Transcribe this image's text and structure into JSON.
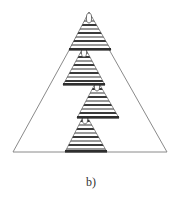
{
  "figure": {
    "caption": "b)"
  },
  "colors": {
    "outline": "#8a8a8a",
    "stripe_dark": "#3a3a3a",
    "stripe_mid": "#7a7a7a",
    "stripe_light": "#bdbdbd",
    "stripe_white": "#ffffff",
    "node_fill": "#ffffff",
    "node_stroke": "#555555"
  },
  "outer_triangle": {
    "apex": [
      89,
      14
    ],
    "base_left": [
      13,
      152
    ],
    "base_right": [
      167,
      152
    ]
  },
  "subtriangles": [
    {
      "id": 1,
      "apex": [
        89,
        12
      ],
      "base_y": 50,
      "base_x": [
        69,
        111
      ],
      "node": [
        89,
        18
      ]
    },
    {
      "id": 2,
      "apex": [
        84,
        46
      ],
      "base_y": 85,
      "base_x": [
        63,
        105
      ],
      "node": [
        84,
        52
      ]
    },
    {
      "id": 3,
      "apex": [
        97,
        80
      ],
      "base_y": 118,
      "base_x": [
        77,
        119
      ],
      "node": [
        97,
        86
      ]
    },
    {
      "id": 4,
      "apex": [
        85,
        113
      ],
      "base_y": 152,
      "base_x": [
        65,
        107
      ],
      "node": [
        85,
        119
      ]
    }
  ]
}
